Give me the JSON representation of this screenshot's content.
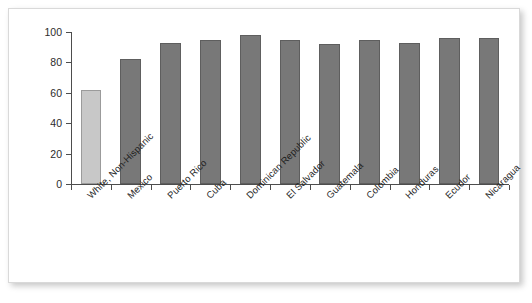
{
  "figure": {
    "background_color": "#ffffff",
    "border_color": "#d9d9d9"
  },
  "chart_data": {
    "type": "bar",
    "title": "",
    "subtitle": "",
    "xlabel": "",
    "ylabel": "",
    "categories": [
      "White, Non-Hispanic",
      "Mexico",
      "Puerto Rico",
      "Cuba",
      "Dominican Republic",
      "El Salvador",
      "Guatemala",
      "Colombia",
      "Honduras",
      "Ecudor",
      "Nicaragua"
    ],
    "values": [
      62,
      82,
      93,
      95,
      98,
      95,
      92,
      95,
      93,
      96,
      96
    ],
    "bar_colors": [
      "#c8c8c8",
      "#787878",
      "#787878",
      "#787878",
      "#787878",
      "#787878",
      "#787878",
      "#787878",
      "#787878",
      "#787878",
      "#787878"
    ],
    "ylim": [
      0,
      100
    ],
    "yticks": [
      0,
      20,
      40,
      60,
      80,
      100
    ],
    "ytick_labels": [
      "0",
      "20",
      "40",
      "60",
      "80",
      "100"
    ],
    "grid": false,
    "legend": null,
    "legend_position": "none",
    "annotations": []
  }
}
